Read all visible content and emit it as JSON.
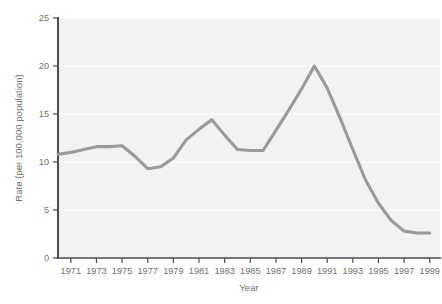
{
  "chart_data": {
    "type": "line",
    "title": "",
    "xlabel": "Year",
    "ylabel": "Rate (per 100,000 population)",
    "xlim": [
      1970,
      1999.8
    ],
    "ylim": [
      0,
      25
    ],
    "grid": true,
    "legend": "none",
    "x_ticks": [
      1971,
      1973,
      1975,
      1977,
      1979,
      1981,
      1983,
      1985,
      1987,
      1989,
      1991,
      1993,
      1995,
      1997,
      1999
    ],
    "y_ticks": [
      0,
      5,
      10,
      15,
      20,
      25
    ],
    "series": [
      {
        "name": "Rate",
        "color": "#9a9a9a",
        "x": [
          1970,
          1971,
          1972,
          1973,
          1974,
          1975,
          1976,
          1977,
          1978,
          1979,
          1980,
          1981,
          1982,
          1983,
          1984,
          1985,
          1986,
          1987,
          1988,
          1989,
          1990,
          1991,
          1992,
          1993,
          1994,
          1995,
          1996,
          1997,
          1998,
          1999
        ],
        "values": [
          10.8,
          11.0,
          11.3,
          11.6,
          11.6,
          11.7,
          10.6,
          9.3,
          9.5,
          10.4,
          12.3,
          13.4,
          14.4,
          12.8,
          11.3,
          11.2,
          11.2,
          13.3,
          15.4,
          17.6,
          20.0,
          17.7,
          14.6,
          11.3,
          8.1,
          5.7,
          3.9,
          2.8,
          2.6,
          2.6
        ]
      }
    ]
  },
  "axes": {
    "y_axis_label": "Rate (per 100,000 population)",
    "x_axis_label": "Year",
    "y_tick_labels": [
      "0",
      "5",
      "10",
      "15",
      "20",
      "25"
    ],
    "x_tick_labels": [
      "1971",
      "1973",
      "1975",
      "1977",
      "1979",
      "1981",
      "1983",
      "1985",
      "1987",
      "1989",
      "1991",
      "1993",
      "1995",
      "1997",
      "1999"
    ]
  },
  "style": {
    "line_color": "#9a9a9a",
    "plot_background": "#f2f2f2",
    "page_background": "#ffffff",
    "grid_color": "#fbfbfb",
    "axis_color": "#4d4d4d",
    "text_color": "#6f6f6f"
  }
}
